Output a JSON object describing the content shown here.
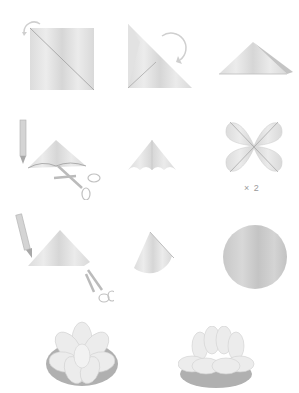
{
  "colors": {
    "paper_light": "#e6e6e6",
    "paper_mid": "#d2d2d2",
    "paper_dark": "#bdbdbd",
    "fold_line": "#9e9e9e",
    "pad_dark": "#a9a9a9",
    "arrow": "#c8c8c8",
    "tool": "#b8b8b8"
  },
  "steps": [
    {
      "id": 1,
      "description": "square sheet with diagonal fold, curved arrow"
    },
    {
      "id": 2,
      "description": "fold into triangle, curved arrow"
    },
    {
      "id": 3,
      "description": "folded triangle"
    },
    {
      "id": 4,
      "description": "pencil mark and scissors cut on triangle"
    },
    {
      "id": 5,
      "description": "scalloped triangle"
    },
    {
      "id": 6,
      "description": "four-petal shape unfolded",
      "multiplier_label": "× 2"
    },
    {
      "id": 7,
      "description": "pencil mark and scissors cut on triangle"
    },
    {
      "id": 8,
      "description": "rounded cone shape"
    },
    {
      "id": 9,
      "description": "circle (lily pad)"
    },
    {
      "id": 10,
      "description": "assembled water lily, top view"
    },
    {
      "id": 11,
      "description": "assembled water lily, side view"
    }
  ]
}
